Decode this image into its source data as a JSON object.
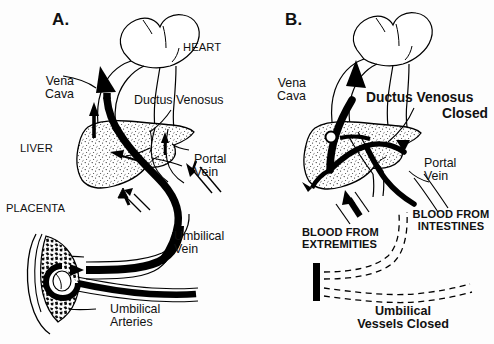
{
  "figure": {
    "type": "medical-illustration",
    "background_color": "#fdfdfd",
    "ink_color": "#000000",
    "liver_fill": "#ffffff",
    "liver_stipple": "#1a1a1a",
    "placenta_fill": "#111111"
  },
  "panels": [
    {
      "letter": "A.",
      "name": "fetal-circulation",
      "labels": [
        {
          "key": "heart",
          "text": "HEART",
          "style": "caps"
        },
        {
          "key": "vena_cava",
          "text": "Vena\nCava",
          "style": "reg"
        },
        {
          "key": "ductus_venosus",
          "text": "Ductus Venosus",
          "style": "reg"
        },
        {
          "key": "liver",
          "text": "LIVER",
          "style": "caps"
        },
        {
          "key": "portal_vein",
          "text": "Portal\nVein",
          "style": "reg"
        },
        {
          "key": "placenta",
          "text": "PLACENTA",
          "style": "caps"
        },
        {
          "key": "umbilical_vein",
          "text": "Umbilical\nVein",
          "style": "reg"
        },
        {
          "key": "umbilical_arteries",
          "text": "Umbilical\nArteries",
          "style": "reg"
        }
      ]
    },
    {
      "letter": "B.",
      "name": "newborn-circulation",
      "labels": [
        {
          "key": "vena_cava",
          "text": "Vena\nCava",
          "style": "reg"
        },
        {
          "key": "ductus_venosus_closed",
          "text": "Ductus Venosus",
          "style": "bold"
        },
        {
          "key": "ductus_closed_line2",
          "text": "Closed",
          "style": "bold"
        },
        {
          "key": "portal_vein",
          "text": "Portal\nVein",
          "style": "reg"
        },
        {
          "key": "blood_from_extremities",
          "text": "BLOOD FROM\nEXTREMITIES",
          "style": "capsb"
        },
        {
          "key": "blood_from_intestines",
          "text": "BLOOD FROM\nINTESTINES",
          "style": "capsb"
        },
        {
          "key": "umbilical_vessels",
          "text": "Umbilical\nVessels Closed",
          "style": "boldsm"
        }
      ]
    }
  ],
  "legend_notes": {
    "solid_black_vessel": "open / flowing vessel",
    "dashed_vessel": "closed / obliterated vessel",
    "stipple_region": "liver parenchyma",
    "dense_texture_region": "placental villi"
  }
}
